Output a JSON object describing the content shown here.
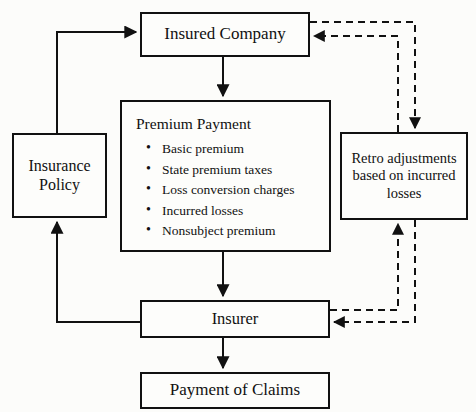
{
  "diagram": {
    "background_color": "#fcfcfa",
    "line_color": "#111111",
    "nodes": {
      "insured_company": {
        "label": "Insured Company"
      },
      "premium_payment": {
        "label": "Premium Payment",
        "items": [
          "Basic premium",
          "State premium taxes",
          "Loss conversion charges",
          "Incurred losses",
          "Nonsubject premium"
        ]
      },
      "insurance_policy": {
        "label": "Insurance\nPolicy"
      },
      "retro_adjustments": {
        "label": "Retro adjustments\nbased on incurred\nlosses"
      },
      "insurer": {
        "label": "Insurer"
      },
      "payment_of_claims": {
        "label": "Payment of Claims"
      }
    },
    "connectors": [
      {
        "id": "policy-to-insured-company",
        "from": "insurance_policy",
        "to": "insured_company",
        "style": "solid",
        "arrow": true
      },
      {
        "id": "insured-company-to-premium-payment",
        "from": "insured_company",
        "to": "premium_payment",
        "style": "solid",
        "arrow": true
      },
      {
        "id": "premium-payment-to-insurer",
        "from": "premium_payment",
        "to": "insurer",
        "style": "solid",
        "arrow": true
      },
      {
        "id": "insurer-to-policy",
        "from": "insurer",
        "to": "insurance_policy",
        "style": "solid",
        "arrow": true
      },
      {
        "id": "insurer-to-payment-of-claims",
        "from": "insurer",
        "to": "payment_of_claims",
        "style": "solid",
        "arrow": true
      },
      {
        "id": "insured-company-to-retro",
        "from": "insured_company",
        "to": "retro_adjustments",
        "style": "dashed",
        "arrow": true
      },
      {
        "id": "retro-to-insured-company",
        "from": "retro_adjustments",
        "to": "insured_company",
        "style": "dashed",
        "arrow": true
      },
      {
        "id": "insurer-to-retro",
        "from": "insurer",
        "to": "retro_adjustments",
        "style": "dashed",
        "arrow": true
      },
      {
        "id": "retro-to-insurer",
        "from": "retro_adjustments",
        "to": "insurer",
        "style": "dashed",
        "arrow": true
      }
    ]
  }
}
